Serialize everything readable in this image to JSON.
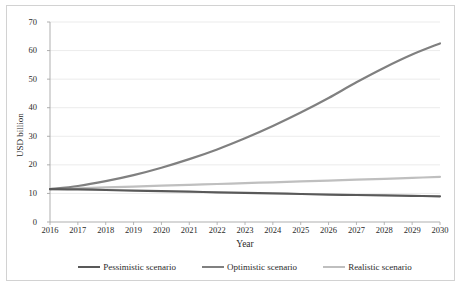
{
  "chart_data": {
    "type": "line",
    "title": "",
    "xlabel": "Year",
    "ylabel": "USD billion",
    "x": [
      2016,
      2017,
      2018,
      2019,
      2020,
      2021,
      2022,
      2023,
      2024,
      2025,
      2026,
      2027,
      2028,
      2029,
      2030
    ],
    "categories": [
      "2016",
      "2017",
      "2018",
      "2019",
      "2020",
      "2021",
      "2022",
      "2023",
      "2024",
      "2025",
      "2026",
      "2027",
      "2028",
      "2029",
      "2030"
    ],
    "xlim": [
      2016,
      2030
    ],
    "ylim": [
      0,
      70
    ],
    "yticks": [
      0,
      10,
      20,
      30,
      40,
      50,
      60,
      70
    ],
    "ytick_labels": [
      "0",
      "10",
      "20",
      "30",
      "40",
      "50",
      "60",
      "70"
    ],
    "grid": "horizontal",
    "legend_position": "bottom",
    "series": [
      {
        "name": "Pessimistic scenario",
        "color": "#595959",
        "values": [
          11.5,
          11.4,
          11.2,
          11.0,
          10.8,
          10.6,
          10.4,
          10.2,
          10.0,
          9.8,
          9.6,
          9.45,
          9.3,
          9.15,
          9.0
        ]
      },
      {
        "name": "Optimistic scenario",
        "color": "#808080",
        "values": [
          11.5,
          12.6,
          14.3,
          16.4,
          19.0,
          22.0,
          25.4,
          29.3,
          33.6,
          38.3,
          43.4,
          48.9,
          54.0,
          58.6,
          62.5
        ]
      },
      {
        "name": "Realistic scenario",
        "color": "#bfbfbf",
        "values": [
          11.5,
          11.8,
          12.1,
          12.4,
          12.7,
          13.0,
          13.3,
          13.6,
          13.9,
          14.2,
          14.5,
          14.8,
          15.1,
          15.45,
          15.8
        ]
      }
    ]
  },
  "axes": {
    "y_title": "USD billion",
    "x_title": "Year"
  },
  "legend": {
    "items": [
      {
        "label": "Pessimistic scenario",
        "color": "#595959"
      },
      {
        "label": "Optimistic scenario",
        "color": "#808080"
      },
      {
        "label": "Realistic scenario",
        "color": "#bfbfbf"
      }
    ]
  },
  "style": {
    "grid_color": "#e3e3e3",
    "axis_color": "#a6a6a6",
    "frame_color": "#d2d2d2",
    "text_color": "#2b2b2b",
    "background": "#ffffff"
  }
}
